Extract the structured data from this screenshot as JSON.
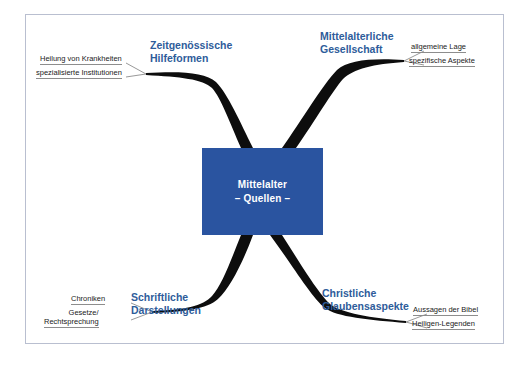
{
  "diagram": {
    "type": "mind-map",
    "colors": {
      "center_fill": "#2a54a0",
      "center_text": "#ffffff",
      "branch_label": "#2e5c9a",
      "branch_stroke": "#000000",
      "subitem_text": "#1b1b1b",
      "subitem_rule": "#8d8d8d",
      "frame_border": "#b9bfd0",
      "background": "#ffffff"
    }
  },
  "center": {
    "line1": "Mittelalter",
    "line2": "– Quellen –"
  },
  "branches": [
    {
      "id": "zeitgenoessische-hilfeformen",
      "position": "top-left",
      "label_line1": "Zeitgenössische",
      "label_line2": "Hilfeformen",
      "subitems": [
        {
          "id": "heilung-von-krankheiten",
          "text": "Heilung von Krankheiten"
        },
        {
          "id": "spezialisierte-institutionen",
          "text": "spezialisierte Institutionen"
        }
      ]
    },
    {
      "id": "mittelalterliche-gesellschaft",
      "position": "top-right",
      "label_line1": "Mittelalterliche",
      "label_line2": "Gesellschaft",
      "subitems": [
        {
          "id": "allgemeine-lage",
          "text": "allgemeine Lage"
        },
        {
          "id": "spezifische-aspekte",
          "text": "spezifische Aspekte"
        }
      ]
    },
    {
      "id": "schriftliche-darstellungen",
      "position": "bottom-left",
      "label_line1": "Schriftliche",
      "label_line2": "Darstellungen",
      "subitems": [
        {
          "id": "chroniken",
          "text": "Chroniken"
        },
        {
          "id": "gesetze-rechtsprechung",
          "text_line1": "Gesetze/",
          "text_line2": "Rechtsprechung"
        }
      ]
    },
    {
      "id": "christliche-glaubensaspekte",
      "position": "bottom-right",
      "label_line1": "Christliche",
      "label_line2": "Glaubensaspekte",
      "subitems": [
        {
          "id": "aussagen-der-bibel",
          "text": "Aussagen der Bibel"
        },
        {
          "id": "heiligen-legenden",
          "text": "Heiligen-Legenden"
        }
      ]
    }
  ]
}
